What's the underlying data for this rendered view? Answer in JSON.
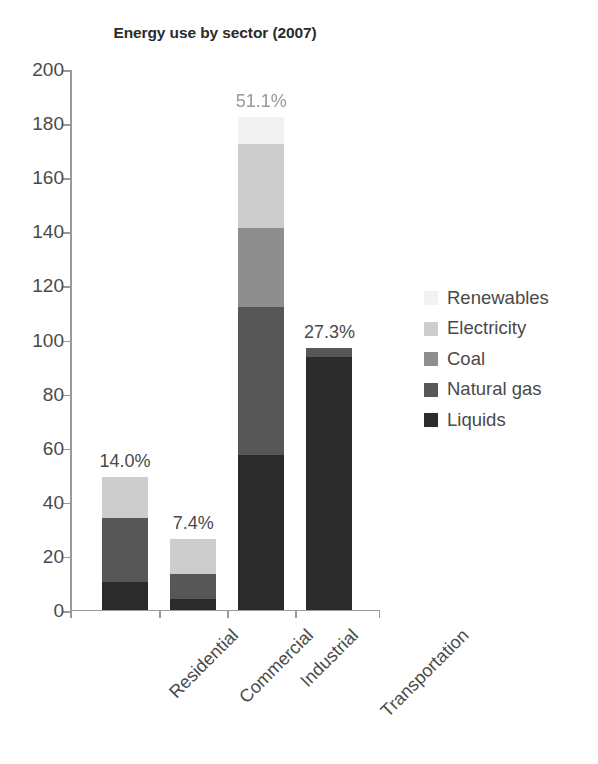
{
  "chart_data": {
    "type": "bar",
    "subtype": "stacked-bar",
    "title": "Energy use by sector (2007)",
    "xlabel": "",
    "ylabel": "",
    "ylim": [
      0,
      200
    ],
    "ytick_labels": [
      "0",
      "20",
      "40",
      "60",
      "80",
      "100",
      "120",
      "140",
      "160",
      "180",
      "200"
    ],
    "ytick_values": [
      0,
      20,
      40,
      60,
      80,
      100,
      120,
      140,
      160,
      180,
      200
    ],
    "grid": false,
    "legend_position": "right",
    "categories": [
      "Residential",
      "Commercial",
      "Industrial",
      "Transportation"
    ],
    "series": [
      {
        "name": "Liquids",
        "color": "#2b2b2b",
        "values": [
          10.0,
          4.0,
          57.0,
          93.2
        ]
      },
      {
        "name": "Natural gas",
        "color": "#575757",
        "values": [
          24.0,
          9.0,
          55.0,
          3.3
        ]
      },
      {
        "name": "Coal",
        "color": "#8e8e8e",
        "values": [
          0.0,
          0.0,
          29.0,
          0.0
        ]
      },
      {
        "name": "Electricity",
        "color": "#cdcdcd",
        "values": [
          15.0,
          13.0,
          31.0,
          0.0
        ]
      },
      {
        "name": "Renewables",
        "color": "#f2f2f2",
        "values": [
          0.0,
          0.0,
          10.0,
          0.0
        ]
      }
    ],
    "bar_totals": [
      49.0,
      26.0,
      182.0,
      96.5
    ],
    "bar_labels": [
      "14.0%",
      "7.4%",
      "51.1%",
      "27.3%"
    ],
    "bar_label_notes": [
      "",
      "",
      "label text is blurred/degraded in the source image",
      ""
    ],
    "legend_entries": [
      {
        "label": "Renewables",
        "color": "#f2f2f2"
      },
      {
        "label": "Electricity",
        "color": "#cdcdcd"
      },
      {
        "label": "Coal",
        "color": "#8e8e8e"
      },
      {
        "label": "Natural gas",
        "color": "#575757"
      },
      {
        "label": "Liquids",
        "color": "#2b2b2b"
      }
    ]
  },
  "colors": {
    "axis": "#9a9a9a",
    "text": "#4a4a4a",
    "title": "#2b2b2b",
    "background": "#ffffff"
  }
}
